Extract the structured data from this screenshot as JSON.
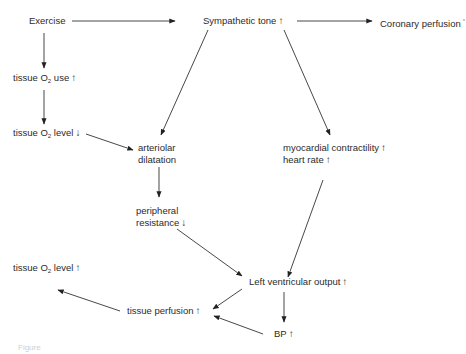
{
  "nodes": {
    "exercise": {
      "label": "Exercise"
    },
    "sympathetic_tone": {
      "label": "Sympathetic tone",
      "arrow": "↑"
    },
    "coronary_perfusion": {
      "label": "Coronary perfusion",
      "arrow": "*"
    },
    "tissue_o2_use": {
      "pre": "tissue O",
      "sub": "2",
      "post": " use",
      "arrow": "↑"
    },
    "tissue_o2_level_down": {
      "pre": "tissue O",
      "sub": "2",
      "post": " level",
      "arrow": "↓"
    },
    "arteriolar_dilatation": {
      "line1": "arteriolar",
      "line2": "dilatation"
    },
    "myocardial": {
      "line1": "myocardial contractility",
      "arrow1": "↑",
      "line2": "heart rate",
      "arrow2": "↑"
    },
    "peripheral_resistance": {
      "line1": "peripheral",
      "line2": "resistance",
      "arrow": "↓"
    },
    "lv_output": {
      "label": "Left ventricular output",
      "arrow": "↑"
    },
    "tissue_o2_level_up": {
      "pre": "tissue O",
      "sub": "2",
      "post": " level",
      "arrow": "↑"
    },
    "tissue_perfusion": {
      "label": "tissue perfusion",
      "arrow": "↑"
    },
    "bp": {
      "label": "BP",
      "arrow": "↑"
    }
  },
  "caption": "Figure"
}
